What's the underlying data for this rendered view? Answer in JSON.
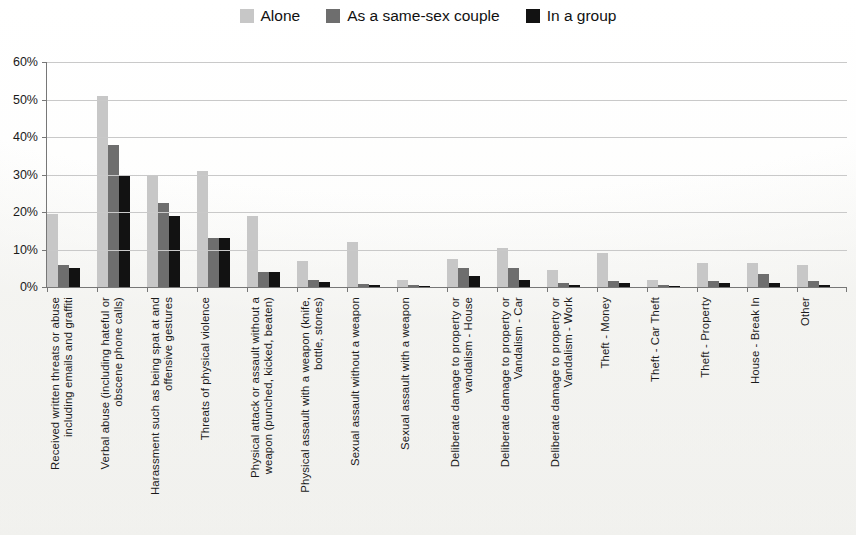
{
  "chart_data": {
    "type": "bar",
    "title": "",
    "subtitle": "",
    "xlabel": "",
    "ylabel": "",
    "ylim": [
      0,
      60
    ],
    "ytick_labels": [
      "60%",
      "50%",
      "40%",
      "30%",
      "20%",
      "10%",
      "0%"
    ],
    "ytick_values": [
      60,
      50,
      40,
      30,
      20,
      10,
      0
    ],
    "grid": true,
    "legend_position": "top-center",
    "value_unit": "%",
    "categories": [
      "Received written threats or abuse\nincluding emails and graffiti",
      "Verbal abuse (including hateful or\nobscene phone calls)",
      "Harassment such as being spat at and\noffensive gestures",
      "Threats of physical violence",
      "Physical attack or assault without a\nweapon (punched, kicked, beaten)",
      "Physical assault with a weapon (knife,\nbottle, stones)",
      "Sexual assault without a weapon",
      "Sexual assault with a weapon",
      "Deliberate damage to property or\nvandalism - House",
      "Deliberate damage to property or\nVandalism - Car",
      "Deliberate damage to property or\nVandalism - Work",
      "Theft - Money",
      "Theft - Car Theft",
      "Theft - Property",
      "House - Break In",
      "Other"
    ],
    "series": [
      {
        "name": "Alone",
        "color": "#c7c7c7",
        "values": [
          19.5,
          51.0,
          30.0,
          31.0,
          19.0,
          7.0,
          12.0,
          2.0,
          7.5,
          10.5,
          4.5,
          9.0,
          2.0,
          6.5,
          6.5,
          6.0
        ]
      },
      {
        "name": "As a same-sex couple",
        "color": "#6e6e6e",
        "values": [
          6.0,
          38.0,
          22.5,
          13.0,
          4.0,
          2.0,
          0.7,
          0.5,
          5.0,
          5.0,
          1.0,
          1.5,
          0.5,
          1.5,
          3.5,
          1.5
        ]
      },
      {
        "name": "In a group",
        "color": "#121212",
        "values": [
          5.0,
          29.5,
          19.0,
          13.0,
          4.0,
          1.3,
          0.5,
          0.4,
          3.0,
          2.0,
          0.6,
          1.0,
          0.4,
          1.0,
          1.0,
          0.5
        ]
      }
    ]
  },
  "legend": {
    "items": [
      {
        "label": "Alone",
        "color": "#c7c7c7"
      },
      {
        "label": "As a same-sex couple",
        "color": "#6e6e6e"
      },
      {
        "label": "In a group",
        "color": "#121212"
      }
    ]
  }
}
